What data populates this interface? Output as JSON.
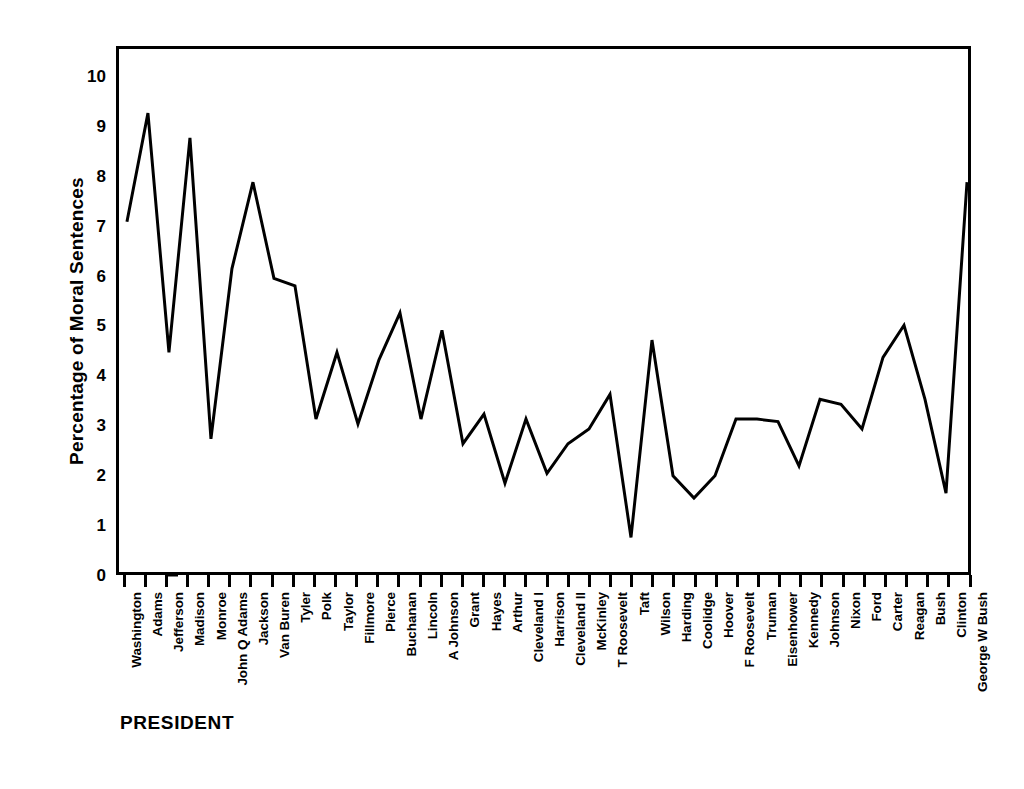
{
  "chart_data": {
    "type": "line",
    "title": "",
    "xlabel": "PRESIDENT",
    "ylabel": "Percentage of Moral Sentences",
    "ylim": [
      0,
      10.6
    ],
    "xlim": [
      0,
      41
    ],
    "grid": false,
    "legend": null,
    "line_color": "#000000",
    "frame_color": "#000000",
    "yticks": [
      0,
      1,
      2,
      3,
      4,
      5,
      6,
      7,
      8,
      9,
      10
    ],
    "ytick_labels": [
      "0",
      "1",
      "2",
      "3",
      "4",
      "5",
      "6",
      "7",
      "8",
      "9",
      "10"
    ],
    "categories": [
      "Washington",
      "Adams",
      "Jefferson",
      "Madison",
      "Monroe",
      "John Q Adams",
      "Jackson",
      "Van Buren",
      "Tyler",
      "Polk",
      "Taylor",
      "Fillmore",
      "Pierce",
      "Buchanan",
      "Lincoln",
      "A Johnson",
      "Grant",
      "Hayes",
      "Arthur",
      "Cleveland I",
      "Harrison",
      "Cleveland II",
      "McKinley",
      "T Roosevelt",
      "Taft",
      "Wilson",
      "Harding",
      "Coolidge",
      "Hoover",
      "F Roosevelt",
      "Truman",
      "Eisenhower",
      "Kennedy",
      "Johnson",
      "Nixon",
      "Ford",
      "Carter",
      "Reagan",
      "Bush",
      "Clinton",
      "George W Bush"
    ],
    "values": [
      7.1,
      9.3,
      4.45,
      8.8,
      2.7,
      6.15,
      7.9,
      5.95,
      5.8,
      3.1,
      4.45,
      3.0,
      4.3,
      5.25,
      3.1,
      4.9,
      2.6,
      3.2,
      1.8,
      3.1,
      2.0,
      2.6,
      2.9,
      3.6,
      0.7,
      4.7,
      1.95,
      1.5,
      1.95,
      3.1,
      3.1,
      3.05,
      2.15,
      3.5,
      3.4,
      2.9,
      4.35,
      5.0,
      3.5,
      1.6,
      7.9
    ]
  }
}
